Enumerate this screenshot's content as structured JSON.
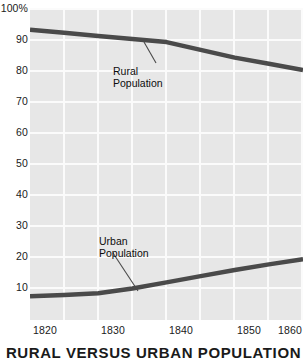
{
  "chart_data": {
    "type": "line",
    "title": "RURAL VERSUS URBAN POPULATION",
    "xlabel": "",
    "ylabel": "",
    "xlim": [
      1820,
      1860
    ],
    "ylim": [
      0,
      100
    ],
    "grid": true,
    "legend_position": "inline-annotations",
    "x_ticks": [
      "1820",
      "1830",
      "1840",
      "1850",
      "1860"
    ],
    "y_ticks": [
      "100%",
      "90",
      "80",
      "70",
      "60",
      "50",
      "40",
      "30",
      "20",
      "10"
    ],
    "x_tick_values": [
      1820,
      1830,
      1840,
      1850,
      1860
    ],
    "y_tick_values": [
      100,
      90,
      80,
      70,
      60,
      50,
      40,
      30,
      20,
      10
    ],
    "x": [
      1820,
      1825,
      1830,
      1835,
      1840,
      1845,
      1850,
      1855,
      1860
    ],
    "series": [
      {
        "name": "Rural Population",
        "values": [
          93,
          92,
          91,
          90,
          89,
          86.5,
          84,
          82,
          80
        ],
        "color": "#4a4a4a"
      },
      {
        "name": "Urban Population",
        "values": [
          7,
          7.4,
          8,
          9.5,
          11.5,
          13.5,
          15.5,
          17.3,
          19
        ],
        "color": "#4a4a4a"
      }
    ],
    "annotations": [
      {
        "id": "rural",
        "line1": "Rural",
        "line2": "Population"
      },
      {
        "id": "urban",
        "line1": "Urban",
        "line2": "Population"
      }
    ],
    "colors": {
      "plot_background": "#e7e7e7",
      "gridline": "#fbfbfb",
      "line": "#4a4a4a",
      "text": "#1a1a1a",
      "page_background": "#ffffff"
    }
  },
  "axis": {
    "y_labels": [
      "100%",
      "90",
      "80",
      "70",
      "60",
      "50",
      "40",
      "30",
      "20",
      "10"
    ],
    "x_labels": [
      "1820",
      "1830",
      "1840",
      "1850",
      "1860"
    ]
  },
  "annotations": {
    "rural": {
      "line1": "Rural",
      "line2": "Population"
    },
    "urban": {
      "line1": "Urban",
      "line2": "Population"
    }
  },
  "title": {
    "text": "RURAL VERSUS URBAN POPULATION"
  }
}
